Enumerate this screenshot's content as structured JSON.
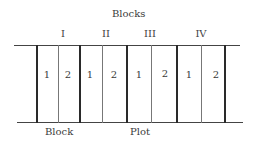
{
  "diagram": {
    "title": "Blocks",
    "blocks": [
      {
        "label": "I",
        "plots": [
          "1",
          "2"
        ]
      },
      {
        "label": "II",
        "plots": [
          "1",
          "2"
        ]
      },
      {
        "label": "III",
        "plots": [
          "1",
          "2"
        ]
      },
      {
        "label": "IV",
        "plots": [
          "1",
          "2"
        ]
      }
    ],
    "bottom_labels": {
      "block": "Block",
      "plot": "Plot"
    }
  }
}
